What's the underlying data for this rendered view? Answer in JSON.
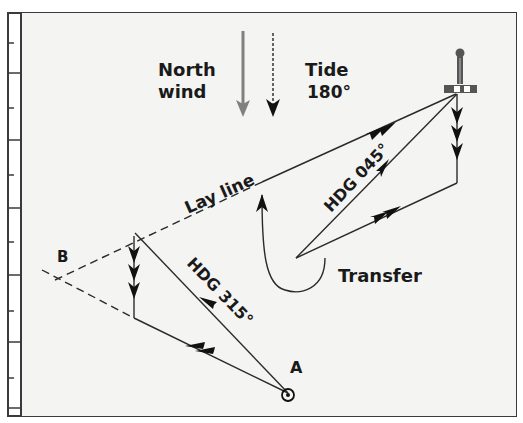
{
  "diagram": {
    "labels": {
      "wind_line1": "North",
      "wind_line2": "wind",
      "tide_line1": "Tide",
      "tide_line2": "180°",
      "lay_line": "Lay line",
      "hdg_045": "HDG 045°",
      "hdg_315": "HDG 315°",
      "transfer": "Transfer",
      "point_a": "A",
      "point_b": "B"
    },
    "icons": {
      "wind_arrow": "arrow-down-gray",
      "tide_arrow": "arrow-down-dashed",
      "mark": "navigation-mark-buoy",
      "start_point": "circle-dot"
    },
    "colors": {
      "background": "#f4f4f2",
      "line": "#2a2a2a",
      "wind_arrow": "#808080",
      "frame": "#3a3a3a"
    },
    "ruler_ticks": 7
  }
}
